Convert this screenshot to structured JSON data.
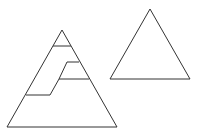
{
  "diagram": {
    "stroke_color": "#333333",
    "background_color": "#ffffff",
    "left_triangle": {
      "outline": [
        [
          62,
          30
        ],
        [
          7,
          127
        ],
        [
          117,
          127
        ]
      ],
      "interior_lines": [
        [
          [
            53,
            46
          ],
          [
            71,
            46
          ]
        ],
        [
          [
            67,
            62
          ],
          [
            79,
            62
          ]
        ],
        [
          [
            67,
            62
          ],
          [
            59,
            79
          ]
        ],
        [
          [
            59,
            79
          ],
          [
            89,
            79
          ]
        ],
        [
          [
            26,
            95
          ],
          [
            50,
            95
          ]
        ],
        [
          [
            50,
            95
          ],
          [
            59,
            79
          ]
        ]
      ]
    },
    "right_triangle": {
      "outline": [
        [
          150,
          9
        ],
        [
          110,
          79
        ],
        [
          190,
          79
        ]
      ]
    }
  }
}
